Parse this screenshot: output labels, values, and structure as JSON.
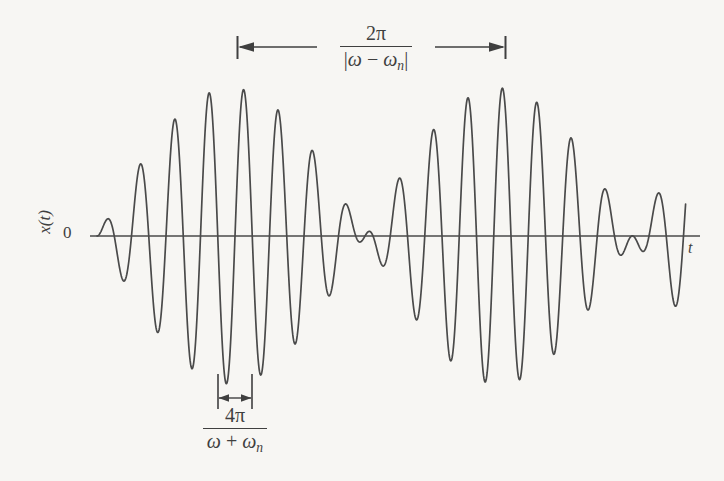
{
  "figure": {
    "type": "beat-phenomenon-waveform",
    "axis_label_y": "x(t)",
    "axis_origin_label": "0",
    "axis_label_x": "t",
    "background_color": "#f7f6f3",
    "curve_color": "#4a4a4a",
    "axis_color": "#4a4a4a"
  },
  "beat_dimension": {
    "numerator": "2π",
    "denominator_open": "|",
    "denominator_omega": "ω",
    "denominator_minus": "−",
    "denominator_omega_n": "ω",
    "denominator_sub_n": "n",
    "denominator_close": "|",
    "full_text": "2π / |ω − ωn|",
    "arrow_left_x": 237,
    "arrow_right_x": 505,
    "arrow_y": 47
  },
  "carrier_dimension": {
    "numerator": "4π",
    "denominator_omega": "ω",
    "denominator_plus": "+",
    "denominator_omega_n": "ω",
    "denominator_sub_n": "n",
    "full_text": "4π / (ω + ωn)",
    "arrow_left_x": 218,
    "arrow_right_x": 252,
    "arrow_y": 398
  },
  "chart_data": {
    "type": "line",
    "title": "",
    "xlabel": "t",
    "ylabel": "x(t)",
    "legend": [],
    "grid": false,
    "xlim": [
      90,
      700
    ],
    "ylim": [
      -150,
      150
    ],
    "axis_y_pixel": 236,
    "x_start_pixel": 90,
    "x_end_pixel": 700,
    "curve_start_pixel": 97,
    "curve_end_pixel": 686,
    "equation": "x(t) = A sin((ω − ωn)t/2) · sin((ω + ωn)t/2)",
    "envelope_description": "amplitude-modulated beats; envelope nodes where |sin((ω−ωn)t/2)| = 0",
    "beat_node_pixels": [
      368,
      625
    ],
    "max_amplitude_pixels": 148,
    "carrier_period_pixels": 34.5,
    "beat_period_pixels": 268,
    "carrier_half_period_pixels": 17.25,
    "envelope_peak_pixels": [
      237,
      505
    ],
    "num_carrier_cycles_visible": 17
  }
}
